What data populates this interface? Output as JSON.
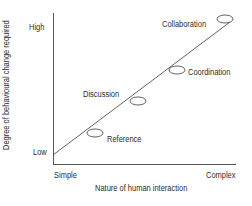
{
  "diagram": {
    "type": "line-with-stages",
    "y_axis": {
      "label": "Degree of behavioural change required",
      "high": "High",
      "low": "Low"
    },
    "x_axis": {
      "label": "Nature of human interaction",
      "start": "Simple",
      "end": "Complex"
    },
    "stages": [
      {
        "label": "Reference"
      },
      {
        "label": "Discussion"
      },
      {
        "label": "Coordination"
      },
      {
        "label": "Collaboration"
      }
    ],
    "colors": {
      "line": "#3a3a3a",
      "text": "#2b2b2b",
      "background": "#ffffff"
    }
  }
}
